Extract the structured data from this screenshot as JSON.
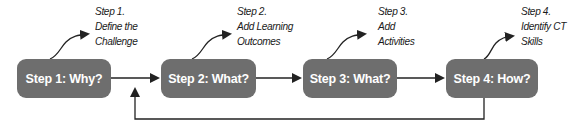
{
  "diagram": {
    "colors": {
      "box_fill": "#6e6e6e",
      "box_text": "#ffffff",
      "line": "#222222",
      "label_text": "#1a1a1a"
    },
    "steps": [
      {
        "box_label": "Step 1: Why?",
        "annotation": [
          "Step 1.",
          "Define the",
          "Challenge"
        ]
      },
      {
        "box_label": "Step 2: What?",
        "annotation": [
          "Step 2.",
          "Add Learning",
          "Outcomes"
        ]
      },
      {
        "box_label": "Step 3: What?",
        "annotation": [
          "Step 3.",
          "Add",
          "Activities"
        ]
      },
      {
        "box_label": "Step 4: How?",
        "annotation": [
          "Step 4.",
          "Identify CT",
          "Skills"
        ]
      }
    ]
  }
}
